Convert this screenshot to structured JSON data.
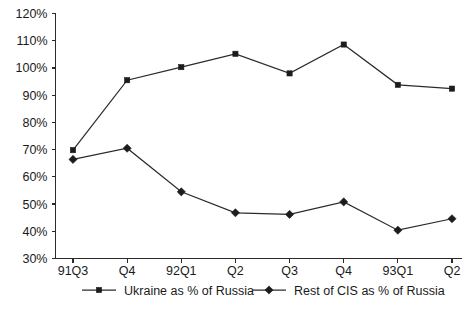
{
  "chart_data": {
    "type": "line",
    "title": "",
    "subtitle": "",
    "xlabel": "",
    "ylabel": "",
    "categories": [
      "91Q3",
      "Q4",
      "92Q1",
      "Q2",
      "Q3",
      "Q4",
      "93Q1",
      "Q2"
    ],
    "ylim": [
      30,
      120
    ],
    "ytick_labels": [
      "120%",
      "110%",
      "100%",
      "90%",
      "80%",
      "70%",
      "60%",
      "50%",
      "40%",
      "30%"
    ],
    "ytick_values": [
      120,
      110,
      100,
      90,
      80,
      70,
      60,
      50,
      40,
      30
    ],
    "grid": false,
    "legend_position": "bottom",
    "series": [
      {
        "name": "Ukraine as % of Russia",
        "marker": "square",
        "color": "#1c1c1c",
        "values": [
          69.8,
          95.5,
          100.3,
          105.2,
          98.0,
          108.6,
          93.8,
          92.4
        ]
      },
      {
        "name": "Rest of CIS as % of Russia",
        "marker": "diamond",
        "color": "#1c1c1c",
        "values": [
          66.4,
          70.5,
          54.5,
          46.8,
          46.2,
          50.8,
          40.4,
          44.6
        ]
      }
    ]
  },
  "legend": {
    "items": [
      {
        "label": "Ukraine as % of Russia",
        "marker": "square"
      },
      {
        "label": "Rest of CIS as % of Russia",
        "marker": "diamond"
      }
    ]
  },
  "axes": {
    "y_min_label": "30%",
    "y_max_label": "120%"
  }
}
